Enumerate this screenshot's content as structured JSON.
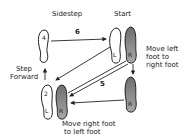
{
  "labels": {
    "sidestep": "Sidestep",
    "start": "Start",
    "step_forward_1": "Step",
    "step_forward_2": "Forward",
    "move_left_1": "Move left",
    "move_left_2": "foot to",
    "move_left_3": "right foot",
    "move_right_1": "Move right foot",
    "move_right_2": "to left foot"
  },
  "step_numbers": {
    "sidestep": "6",
    "diagonal": "5"
  },
  "feet": [
    {
      "id": "start-left",
      "letter": "L",
      "filled": false
    },
    {
      "id": "start-right",
      "letter": "R",
      "filled": true
    },
    {
      "id": "moved-right",
      "letter": "R",
      "filled": true
    },
    {
      "id": "bottom-left",
      "letter": "L",
      "number": "2",
      "filled": false
    },
    {
      "id": "bottom-right",
      "letter": "R",
      "filled": true
    },
    {
      "id": "top-left",
      "number": "4",
      "filled": false
    }
  ],
  "colors": {
    "ink": "#222222",
    "fill": "#8a8a8a"
  }
}
